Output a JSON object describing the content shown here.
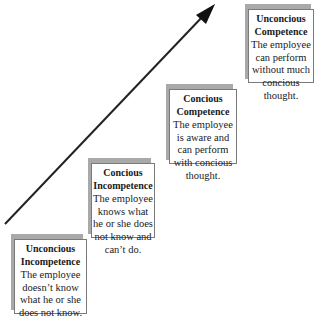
{
  "diagram": {
    "type": "staircase-progression",
    "arrow": {
      "direction": "up-right",
      "color": "#222222"
    },
    "stages": [
      {
        "title": "Unconcious Incompetence",
        "title_lines": [
          "Unconcious",
          "Incompetence"
        ],
        "description": "The employee doesn't know what he or she does not know.",
        "description_lines": [
          "The employee",
          "doesn’t know",
          "what he or she",
          "does not know."
        ]
      },
      {
        "title": "Concious Incompetence",
        "title_lines": [
          "Concious",
          "Incompetence"
        ],
        "description": "The employee knows what he or she does not know and can't do.",
        "description_lines": [
          "The employee",
          "knows what",
          "he or she does",
          "not know and",
          "can’t do."
        ]
      },
      {
        "title": "Concious Competence",
        "title_lines": [
          "Concious",
          "Competence"
        ],
        "description": "The employee is aware and can perform with concious thought.",
        "description_lines": [
          "The employee",
          "is aware and",
          "can perform",
          "with concious",
          "thought."
        ]
      },
      {
        "title": "Unconcious Competence",
        "title_lines": [
          "Unconcious",
          "Competence"
        ],
        "description": "The employee can perform without much concious thought.",
        "description_lines": [
          "The employee",
          "can perform",
          "without much",
          "concious",
          "thought."
        ]
      }
    ]
  }
}
